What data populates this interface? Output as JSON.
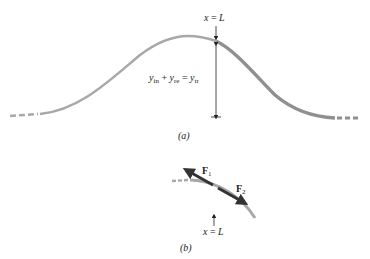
{
  "figure_a": {
    "caption": "(a)",
    "position_label": "x = L",
    "equation": {
      "y1": "y",
      "s1": "in",
      "plus": "+",
      "y2": "y",
      "s2": "re",
      "eq": "=",
      "y3": "y",
      "s3": "tr"
    }
  },
  "figure_b": {
    "caption": "(b)",
    "position_label": "x = L",
    "force1": {
      "symbol": "F",
      "sub": "1"
    },
    "force2": {
      "symbol": "F",
      "sub": "2"
    }
  },
  "colors": {
    "string": "#a8a8a8",
    "string_right": "#909090",
    "force_arrow": "#333333",
    "text": "#222222"
  }
}
